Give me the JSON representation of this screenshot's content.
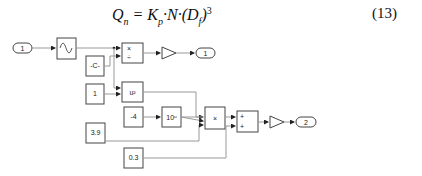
{
  "equation": {
    "lhs": "Q",
    "lhs_sub": "n",
    "k": "K",
    "k_sub": "p",
    "n": "N",
    "d": "D",
    "d_sub": "f",
    "power": "3",
    "number": "(13)"
  },
  "blocks": {
    "inport1": "1",
    "outport1": "1",
    "outport2": "2",
    "constant_c": "-C-",
    "const_1": "1",
    "const_neg4": "-4",
    "const_3_9": "3.9",
    "const_0_3": "0.3",
    "pow_block": "u²",
    "pow10_block": "10ᵘ",
    "product_x_sign": "×",
    "divide_sign": "÷",
    "product_main": "×",
    "sum_plus": "+"
  }
}
